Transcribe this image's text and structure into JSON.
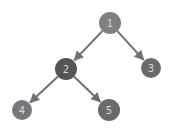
{
  "diagram": {
    "type": "binary-tree",
    "colors": {
      "edge": "#707070",
      "node_default": "#7a7a7a",
      "node_highlight": "#555555",
      "label": "#d8d8d8",
      "background": "#ffffff"
    },
    "nodes": [
      {
        "id": "1",
        "label": "1",
        "x": 110,
        "y": 23,
        "r": 11,
        "fill": "#7f7f7f"
      },
      {
        "id": "2",
        "label": "2",
        "x": 66,
        "y": 69,
        "r": 11,
        "fill": "#555555"
      },
      {
        "id": "3",
        "label": "3",
        "x": 151,
        "y": 68,
        "r": 10,
        "fill": "#6a6a6a"
      },
      {
        "id": "4",
        "label": "4",
        "x": 22,
        "y": 110,
        "r": 10,
        "fill": "#777777"
      },
      {
        "id": "5",
        "label": "5",
        "x": 109,
        "y": 110,
        "r": 11,
        "fill": "#6a6a6a"
      }
    ],
    "edges": [
      {
        "from": "1",
        "to": "2"
      },
      {
        "from": "1",
        "to": "3"
      },
      {
        "from": "2",
        "to": "4"
      },
      {
        "from": "2",
        "to": "5"
      }
    ]
  }
}
